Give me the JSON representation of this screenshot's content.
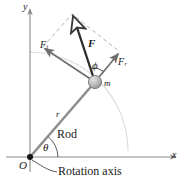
{
  "figure": {
    "background": "#ffffff"
  },
  "axes": {
    "y_label": "y",
    "x_label": "x",
    "origin_label": "O",
    "color": "#8a8a8a"
  },
  "labels": {
    "rod": "Rod",
    "rotation_axis": "Rotation axis",
    "radius": "r",
    "mass": "m",
    "theta": "θ",
    "phi": "ϕ",
    "force": "F",
    "force_tangential": "F",
    "force_tangential_sub": "t",
    "force_radial": "F",
    "force_radial_sub": "r"
  },
  "colors": {
    "rod": "#8f8f8f",
    "force_vector": "#2b2b2b",
    "component_vector": "#6e6e6e",
    "dashed": "#b5b5b5",
    "arc": "#d8d8d8",
    "mass_fill": "#b9b9b9",
    "mass_stroke": "#7a7a7a",
    "text": "#1a1a1a"
  },
  "geometry": {
    "origin": [
      30,
      157
    ],
    "mass_center": [
      95,
      82
    ],
    "mass_radius": 6.5,
    "force_tip": [
      72,
      14
    ],
    "tangential_tip": [
      43,
      47
    ],
    "radial_tip": [
      120,
      52
    ],
    "parallelogram_corner": [
      72,
      14
    ],
    "theta_degrees": 49,
    "phi_degrees": 37
  }
}
